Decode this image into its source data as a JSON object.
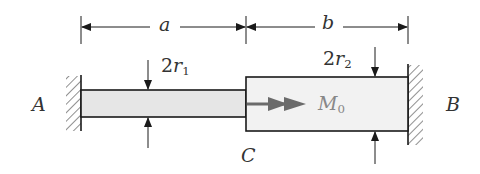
{
  "figure": {
    "type": "stepped shaft fixed at both ends with applied torque",
    "colors": {
      "line": "#1a1a1a",
      "bar_fill": "#e6e6e6",
      "bar_fill_large": "#f2f2f2",
      "torque_arrow": "#6b6b6b",
      "label": "#333333"
    }
  },
  "labels": {
    "support_left": "A",
    "support_right": "B",
    "joint": "C",
    "length_left": "a",
    "length_right": "b",
    "diameter_left": {
      "coef": "2",
      "var": "r",
      "sub": "1"
    },
    "diameter_right": {
      "coef": "2",
      "var": "r",
      "sub": "2"
    },
    "torque": {
      "var": "M",
      "sub": "0"
    }
  }
}
